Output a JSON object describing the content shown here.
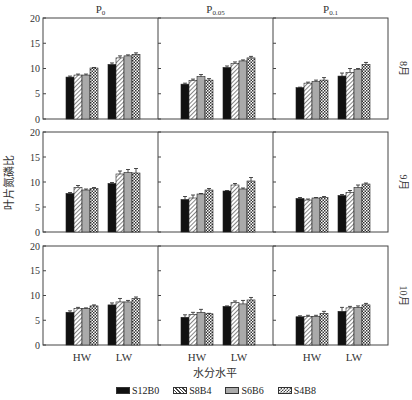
{
  "chart_data": {
    "type": "bar",
    "title": "",
    "ylabel": "叶片氮磷比",
    "xlabel": "水分水平",
    "ylim": [
      0,
      20
    ],
    "yticks": [
      0,
      5,
      10,
      15,
      20
    ],
    "categories": [
      "HW",
      "LW"
    ],
    "columns": [
      "P0",
      "P0.05",
      "P0.1"
    ],
    "column_labels": [
      {
        "base": "P",
        "sub": "0"
      },
      {
        "base": "P",
        "sub": "0.05"
      },
      {
        "base": "P",
        "sub": "0.1"
      }
    ],
    "rows": [
      "8月",
      "9月",
      "10月"
    ],
    "series_names": [
      "S12B0",
      "S8B4",
      "S6B6",
      "S4B8"
    ],
    "series_patterns": [
      "solid-black",
      "diagonal-hatch",
      "solid-gray",
      "checker"
    ],
    "panels": [
      {
        "row": "8月",
        "col": "P0",
        "HW": [
          8.3,
          8.7,
          8.7,
          10.1
        ],
        "LW": [
          10.8,
          12.1,
          12.5,
          12.8
        ],
        "err_HW": [
          0.2,
          0.2,
          0.2,
          0.1
        ],
        "err_LW": [
          0.3,
          0.4,
          0.2,
          0.3
        ]
      },
      {
        "row": "8月",
        "col": "P0.05",
        "HW": [
          6.9,
          7.6,
          8.4,
          7.7
        ],
        "LW": [
          10.2,
          11.0,
          11.5,
          12.1
        ],
        "err_HW": [
          0.2,
          0.3,
          0.4,
          0.3
        ],
        "err_LW": [
          0.3,
          0.3,
          0.2,
          0.3
        ]
      },
      {
        "row": "8月",
        "col": "P0.1",
        "HW": [
          6.2,
          7.1,
          7.4,
          7.7
        ],
        "LW": [
          8.5,
          9.2,
          9.8,
          10.8
        ],
        "err_HW": [
          0.1,
          0.2,
          0.3,
          0.5
        ],
        "err_LW": [
          0.6,
          0.8,
          0.2,
          0.4
        ]
      },
      {
        "row": "9月",
        "col": "P0",
        "HW": [
          7.7,
          8.9,
          8.4,
          8.7
        ],
        "LW": [
          9.7,
          11.6,
          11.9,
          11.8
        ],
        "err_HW": [
          0.2,
          0.4,
          0.2,
          0.2
        ],
        "err_LW": [
          0.2,
          0.6,
          0.6,
          0.9
        ]
      },
      {
        "row": "9月",
        "col": "P0.05",
        "HW": [
          6.5,
          6.8,
          7.6,
          8.4
        ],
        "LW": [
          8.2,
          9.4,
          8.6,
          10.2
        ],
        "err_HW": [
          0.6,
          0.6,
          0.1,
          0.3
        ],
        "err_LW": [
          0.1,
          0.3,
          0.2,
          0.7
        ]
      },
      {
        "row": "9月",
        "col": "P0.1",
        "HW": [
          6.7,
          6.4,
          6.8,
          6.9
        ],
        "LW": [
          7.3,
          7.9,
          8.9,
          9.6
        ],
        "err_HW": [
          0.2,
          0.2,
          0.1,
          0.2
        ],
        "err_LW": [
          0.2,
          0.4,
          0.5,
          0.2
        ]
      },
      {
        "row": "10月",
        "col": "P0",
        "HW": [
          6.6,
          7.4,
          7.4,
          7.9
        ],
        "LW": [
          8.1,
          8.7,
          8.7,
          9.4
        ],
        "err_HW": [
          0.3,
          0.2,
          0.1,
          0.2
        ],
        "err_LW": [
          0.4,
          0.7,
          0.3,
          0.3
        ]
      },
      {
        "row": "10月",
        "col": "P0.05",
        "HW": [
          5.6,
          6.2,
          6.6,
          6.3
        ],
        "LW": [
          7.8,
          8.6,
          8.3,
          9.1
        ],
        "err_HW": [
          0.5,
          0.4,
          0.6,
          0.1
        ],
        "err_LW": [
          0.1,
          0.3,
          0.7,
          0.5
        ]
      },
      {
        "row": "10月",
        "col": "P0.1",
        "HW": [
          5.7,
          5.8,
          5.8,
          6.4
        ],
        "LW": [
          6.8,
          7.5,
          7.6,
          8.1
        ],
        "err_HW": [
          0.2,
          0.2,
          0.2,
          0.4
        ],
        "err_LW": [
          0.8,
          0.3,
          0.3,
          0.3
        ]
      }
    ],
    "grid": false,
    "legend_position": "bottom"
  },
  "legend": {
    "items": [
      {
        "label": "S12B0"
      },
      {
        "label": "S8B4"
      },
      {
        "label": "S6B6"
      },
      {
        "label": "S4B8"
      }
    ]
  },
  "colors": {
    "axis": "#444444",
    "bar_black": "#111111",
    "bar_gray": "#aaaaaa",
    "hatch": "#444444"
  }
}
